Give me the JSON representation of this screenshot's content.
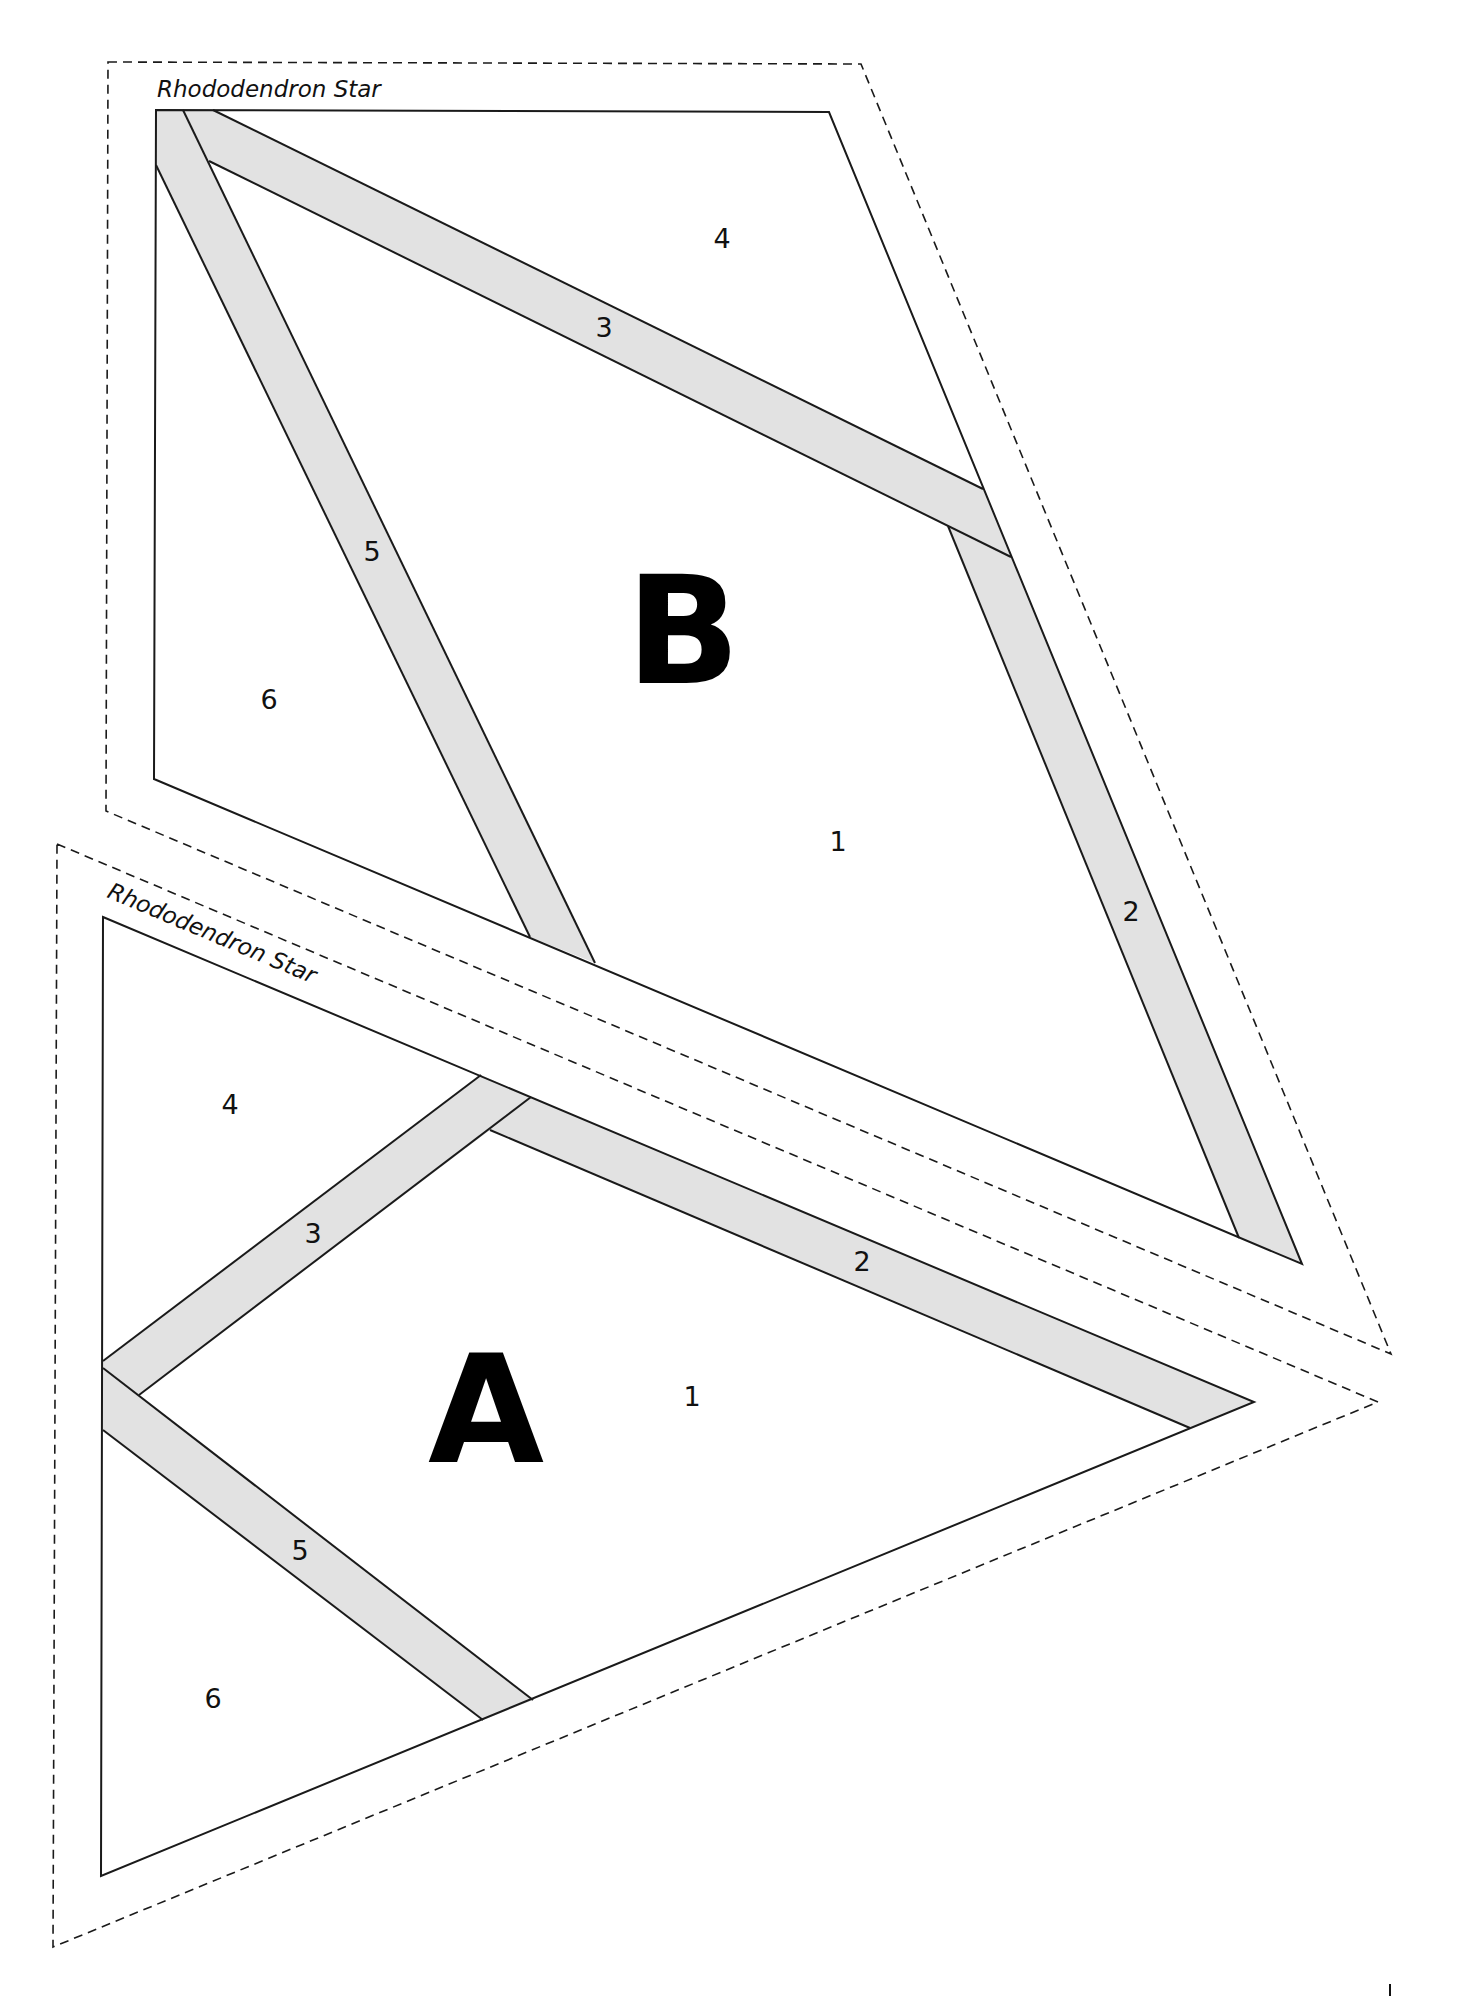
{
  "document": {
    "type": "foundation paper piecing pattern",
    "pieces": [
      {
        "id": "B",
        "title": "Rhododendron Star",
        "letter": "B",
        "section_labels": [
          "1",
          "2",
          "3",
          "4",
          "5",
          "6"
        ],
        "labels": {
          "s1": "1",
          "s2": "2",
          "s3": "3",
          "s4": "4",
          "s5": "5",
          "s6": "6"
        }
      },
      {
        "id": "A",
        "title": "Rhododendron Star",
        "letter": "A",
        "section_labels": [
          "1",
          "2",
          "3",
          "4",
          "5",
          "6"
        ],
        "labels": {
          "s1": "1",
          "s2": "2",
          "s3": "3",
          "s4": "4",
          "s5": "5",
          "s6": "6"
        }
      }
    ],
    "colors": {
      "band_fill": "#e2e2e2",
      "line": "#1a1a1a",
      "background": "#ffffff"
    }
  }
}
